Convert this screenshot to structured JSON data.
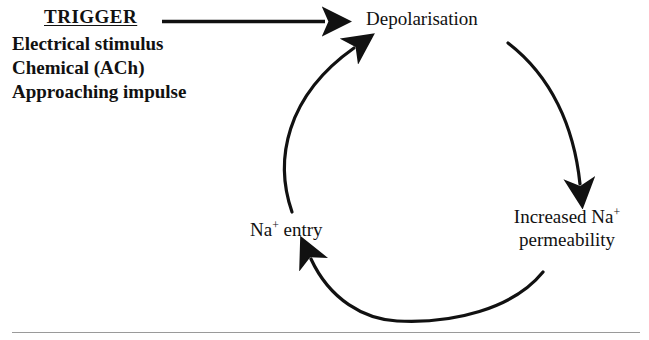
{
  "diagram": {
    "type": "cycle-diagram",
    "title_text": "TRIGGER",
    "trigger": {
      "heading": "TRIGGER",
      "items": [
        "Electrical stimulus",
        "Chemical (ACh)",
        "Approaching impulse"
      ],
      "arrow_label": "trigger-arrow"
    },
    "nodes": [
      {
        "id": "depolarisation",
        "label": "Depolarisation"
      },
      {
        "id": "increased-na-permeability",
        "line1_prefix": "Increased Na",
        "line1_sup": "+",
        "line2": "permeability"
      },
      {
        "id": "na-entry",
        "prefix": "Na",
        "sup": "+",
        "suffix": " entry"
      }
    ],
    "arrows": [
      {
        "id": "trigger-arrow",
        "from": "trigger",
        "to": "depolarisation",
        "style": "straight"
      },
      {
        "id": "arc-depolarisation-to-permeability",
        "from": "depolarisation",
        "to": "increased-na-permeability",
        "style": "curved"
      },
      {
        "id": "arc-permeability-to-na-entry",
        "from": "increased-na-permeability",
        "to": "na-entry",
        "style": "curved"
      },
      {
        "id": "arc-na-entry-to-depolarisation",
        "from": "na-entry",
        "to": "depolarisation",
        "style": "curved"
      }
    ],
    "colors": {
      "ink": "#111111",
      "background": "#ffffff",
      "rule": "#9a9a9a"
    }
  }
}
